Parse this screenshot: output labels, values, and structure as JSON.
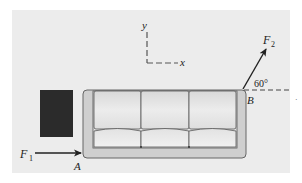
{
  "diagram": {
    "axes": {
      "y_label": "y",
      "x_label": "x"
    },
    "forces": [
      {
        "name": "F",
        "subscript": "1",
        "point": "A",
        "direction": "horizontal, to the right"
      },
      {
        "name": "F",
        "subscript": "2",
        "point": "B",
        "angle_label": "60°",
        "direction": "60° above horizontal"
      }
    ],
    "points": {
      "A": "A",
      "B": "B"
    },
    "angle_label": "60°",
    "dot_mark": "·",
    "colors": {
      "panel": "#ececec",
      "sofa_frame": "#cfcfcf",
      "cushion": "#e4e4e4",
      "outline": "#555555",
      "dark_box": "#2b2b2b",
      "arrow": "#222222"
    }
  }
}
